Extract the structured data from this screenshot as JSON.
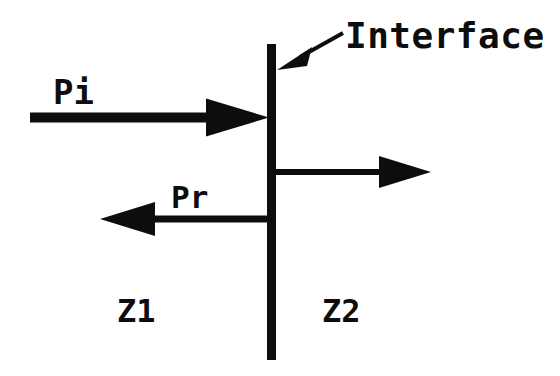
{
  "diagram": {
    "background_color": "#ffffff",
    "ink_color": "#0d0d0d",
    "labels": {
      "incident": "Pi",
      "reflected": "Pr",
      "medium_left": "Z1",
      "medium_right": "Z2",
      "interface": "Interface"
    },
    "elements": {
      "interface_line": {
        "name": "interface-line",
        "orientation": "vertical",
        "x": 271.5,
        "y_top": 44,
        "y_bottom": 360,
        "thickness": 9
      },
      "incident_arrow": {
        "name": "incident-wave-arrow",
        "direction": "right",
        "shaft_x_start": 30,
        "shaft_x_end": 208,
        "y": 117.5,
        "shaft_thickness": 10,
        "head_length": 62,
        "head_half_height": 19
      },
      "reflected_arrow": {
        "name": "reflected-wave-arrow",
        "direction": "left",
        "shaft_x_start": 267,
        "shaft_x_end": 154,
        "y": 219,
        "shaft_thickness": 7,
        "head_length": 55,
        "head_half_height": 17
      },
      "transmitted_arrow": {
        "name": "transmitted-wave-arrow",
        "direction": "right",
        "shaft_x_start": 276,
        "shaft_x_end": 380,
        "y": 172,
        "shaft_thickness": 6,
        "head_length": 52,
        "head_half_height": 16
      },
      "interface_pointer": {
        "name": "interface-pointer-arrow",
        "direction": "down-left",
        "tail_x": 342,
        "tail_y": 34,
        "tip_x": 278,
        "tip_y": 70,
        "head_length": 34
      }
    },
    "label_positions": {
      "incident": {
        "x": 53,
        "y": 104
      },
      "reflected": {
        "x": 171,
        "y": 208
      },
      "medium_left": {
        "x": 117,
        "y": 322
      },
      "medium_right": {
        "x": 322,
        "y": 322
      },
      "interface": {
        "x": 345,
        "y": 48
      }
    }
  }
}
